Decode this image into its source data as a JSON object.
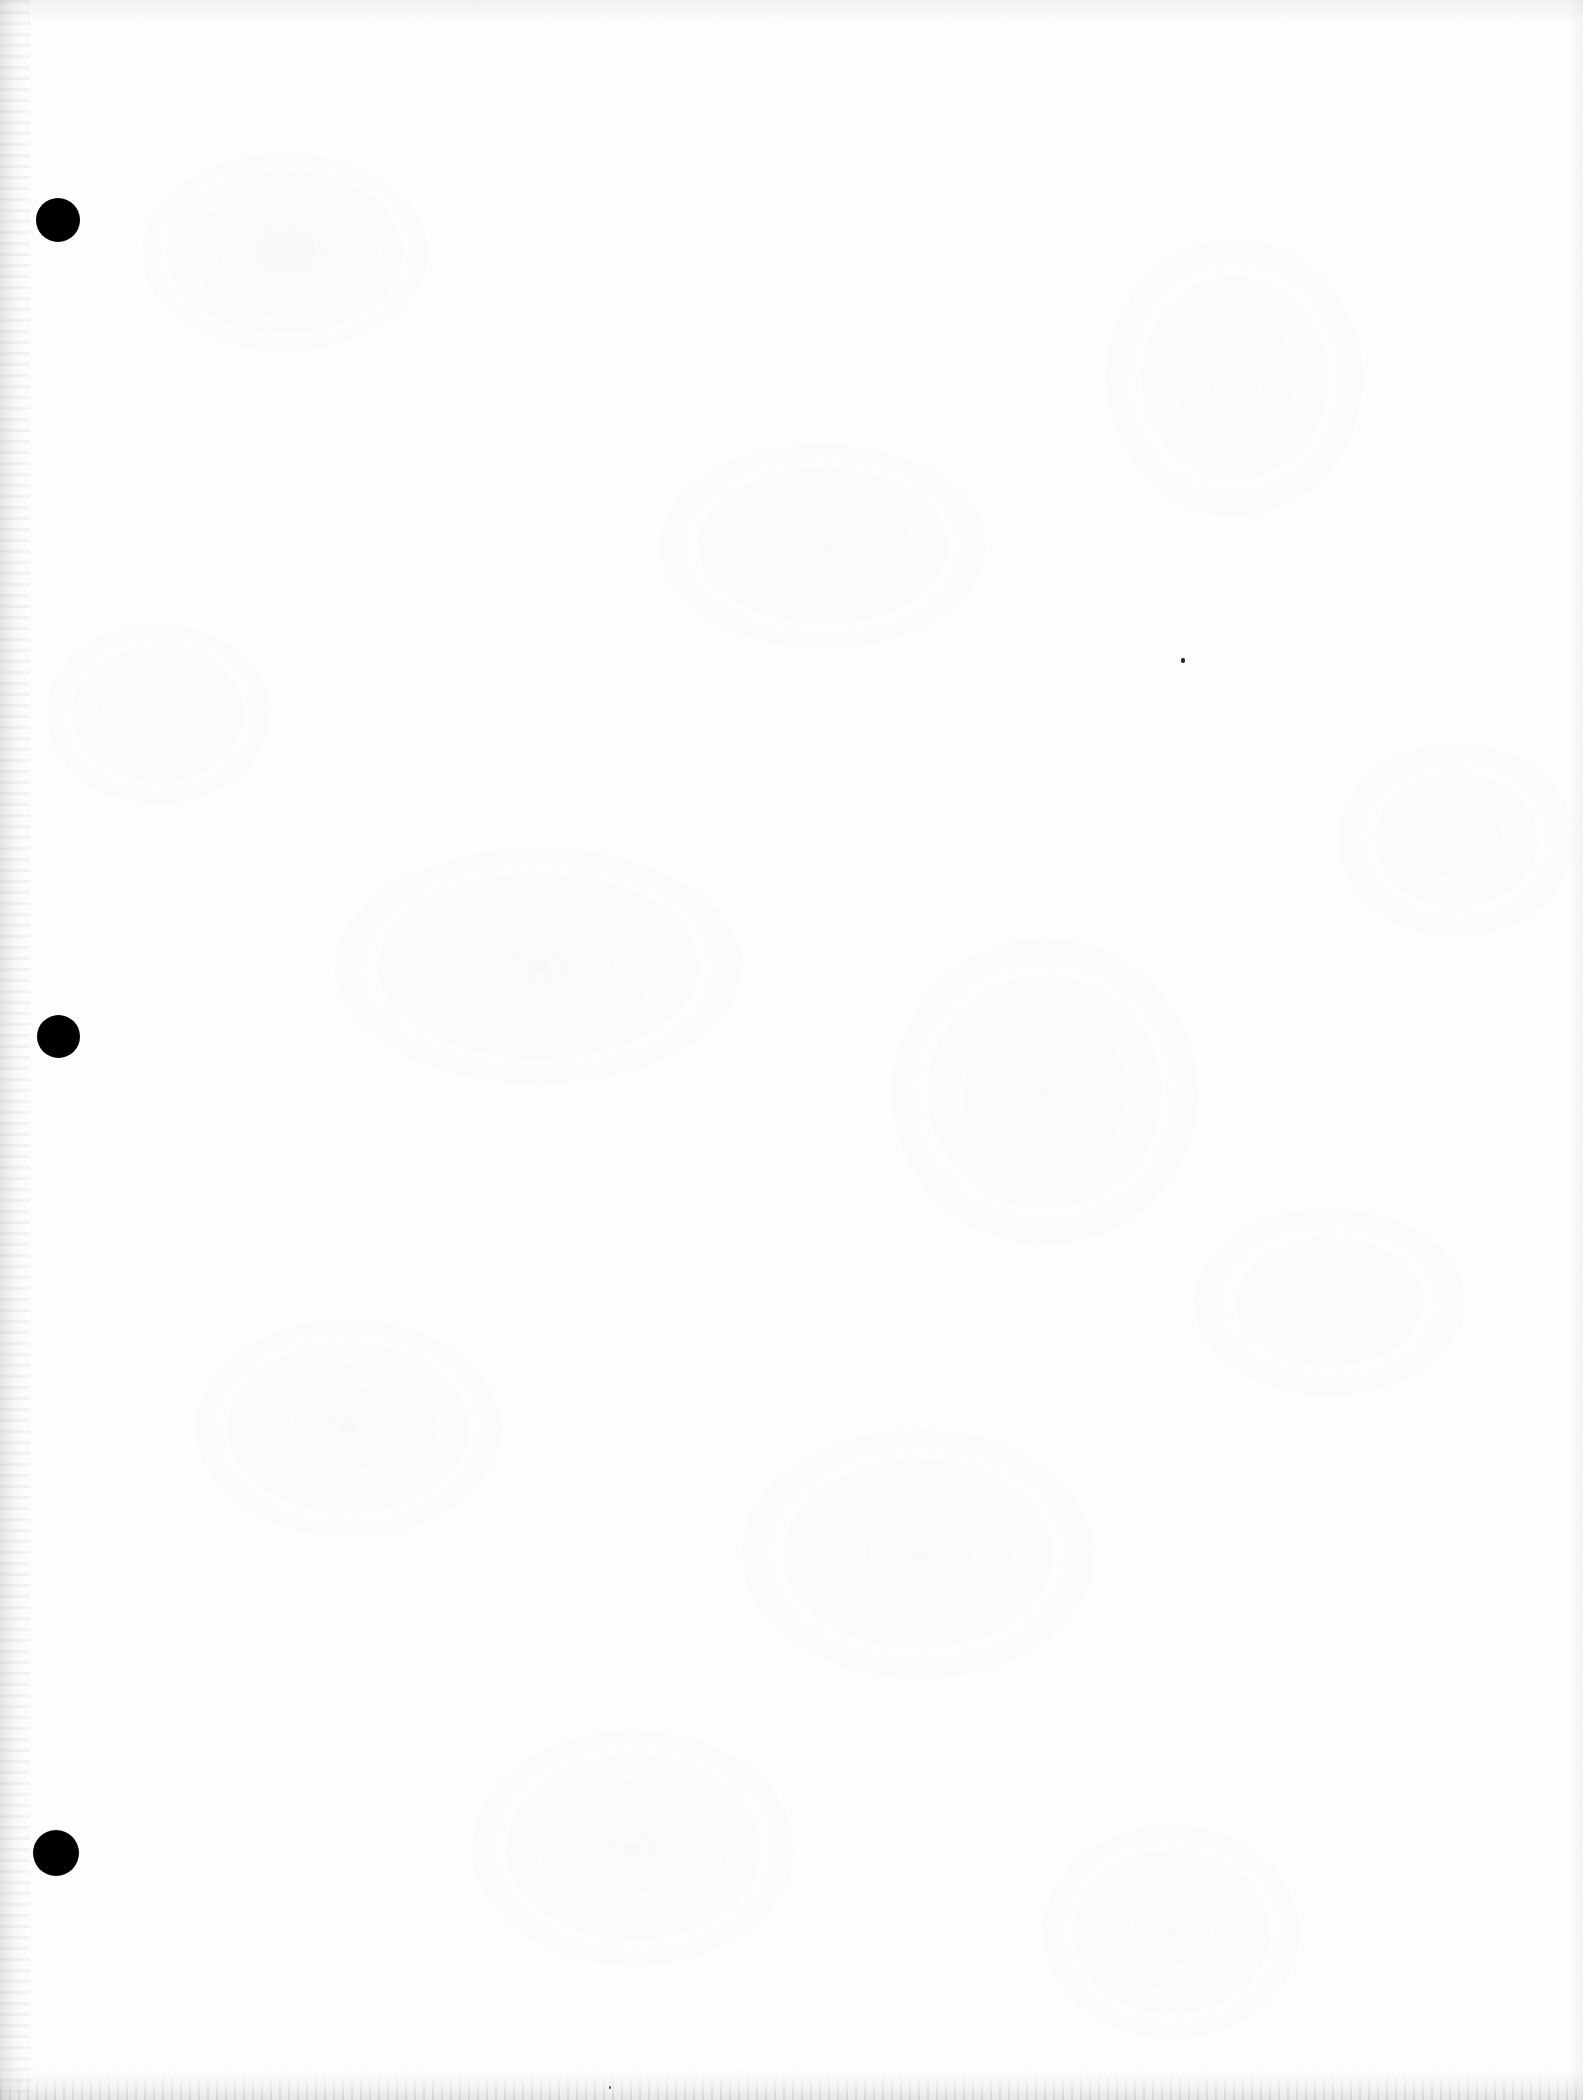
{
  "document": {
    "page_kind": "scanned-blank-page",
    "page_description": "Blank scanned document page",
    "page_width_px": 1583,
    "page_height_px": 2100,
    "paper_color": "#fdfdfd",
    "ink_color": "#000000",
    "visible_text": "",
    "text_content_count": 0
  },
  "margin_holes": {
    "label": "hole-punch marks",
    "count": 3,
    "color": "#000000",
    "items": [
      {
        "name": "top-hole",
        "cx": 58,
        "cy": 220,
        "diameter": 44
      },
      {
        "name": "middle-hole",
        "cx": 58,
        "cy": 1036,
        "diameter": 43
      },
      {
        "name": "bottom-hole",
        "cx": 56,
        "cy": 1853,
        "diameter": 46
      }
    ]
  },
  "artifacts": {
    "specks": [
      {
        "name": "center-speck",
        "x": 1181,
        "y": 658,
        "w": 4,
        "h": 5,
        "color": "#2a2a2a"
      },
      {
        "name": "bottom-edge-speck",
        "x": 609,
        "y": 2086,
        "w": 2,
        "h": 3,
        "color": "#555555"
      }
    ],
    "edges": {
      "left_edge_shadow": "#969698",
      "top_edge_shadow": "#969698",
      "right_edge_shadow": "#969698",
      "bottom_edge_streaks": "#8a8a94"
    }
  }
}
